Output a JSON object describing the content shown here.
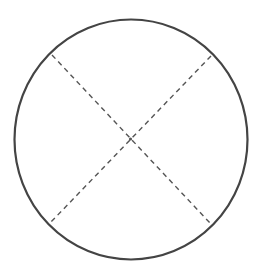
{
  "diagram": {
    "type": "circle-with-crossed-diameters",
    "background": "#ffffff",
    "circle": {
      "cx": 131,
      "cy": 139.5,
      "rx": 116.5,
      "ry": 120,
      "stroke": "#444444",
      "stroke_width": 2.2
    },
    "center_point": {
      "x": 130.5,
      "y": 139
    },
    "diameters": [
      {
        "name": "diagonal-top-left-to-bottom-right",
        "x1": 52,
        "y1": 55,
        "x2": 210,
        "y2": 223,
        "style": "dashed"
      },
      {
        "name": "diagonal-top-right-to-bottom-left",
        "x1": 211,
        "y1": 56,
        "x2": 51,
        "y2": 222,
        "style": "dashed"
      }
    ],
    "dash_color": "#555555",
    "dash_pattern": "5 4",
    "dash_width": 1.4
  }
}
